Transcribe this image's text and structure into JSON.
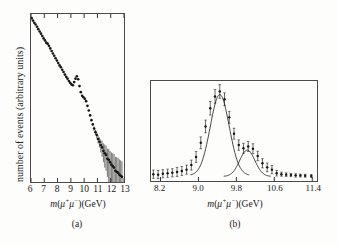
{
  "figure": {
    "background_color": "#fdfdfb",
    "ink_color": "#161616"
  },
  "panel_a": {
    "caption": "(a)",
    "ylabel": "number of events (arbitrary units)",
    "xlabel_prefix": "m",
    "xlabel_open": "(",
    "xlabel_mu_plus": "μ",
    "xlabel_sup_plus": "+",
    "xlabel_mu_minus": "μ",
    "xlabel_sup_minus": "−",
    "xlabel_close": ")(GeV)",
    "xlabel_full": "m(μ+μ−)(GeV)",
    "xticks": [
      "6",
      "7",
      "8",
      "9",
      "10",
      "11",
      "12",
      "13"
    ]
  },
  "panel_b": {
    "caption": "(b)",
    "xlabel_full": "m(μ+μ−)(GeV)",
    "xticks": [
      "8.2",
      "9.0",
      "9.8",
      "10.6",
      "11.4"
    ]
  },
  "chart_data": [
    {
      "type": "scatter",
      "panel": "a",
      "title": "",
      "xlabel": "m(μ+μ−)(GeV)",
      "ylabel": "number of events (arbitrary units)",
      "xlim": [
        6,
        13
      ],
      "ylim": [
        0.0008,
        1.2
      ],
      "yscale": "log",
      "grid": false,
      "legend": "none",
      "notes": "Dimuon invariant-mass spectrum; falling continuum with an excess (Upsilon) near 9.5 GeV; growing statistical error bars above 11 GeV.",
      "points": [
        {
          "x": 6.05,
          "y": 1.0,
          "err": 0.0
        },
        {
          "x": 6.15,
          "y": 0.9,
          "err": 0.0
        },
        {
          "x": 6.25,
          "y": 0.82,
          "err": 0.0
        },
        {
          "x": 6.35,
          "y": 0.76,
          "err": 0.0
        },
        {
          "x": 6.45,
          "y": 0.69,
          "err": 0.0
        },
        {
          "x": 6.55,
          "y": 0.62,
          "err": 0.0
        },
        {
          "x": 6.65,
          "y": 0.56,
          "err": 0.0
        },
        {
          "x": 6.75,
          "y": 0.51,
          "err": 0.0
        },
        {
          "x": 6.85,
          "y": 0.46,
          "err": 0.0
        },
        {
          "x": 6.95,
          "y": 0.415,
          "err": 0.0
        },
        {
          "x": 7.05,
          "y": 0.38,
          "err": 0.0
        },
        {
          "x": 7.15,
          "y": 0.345,
          "err": 0.0
        },
        {
          "x": 7.25,
          "y": 0.33,
          "err": 0.0
        },
        {
          "x": 7.35,
          "y": 0.3,
          "err": 0.0
        },
        {
          "x": 7.45,
          "y": 0.268,
          "err": 0.0
        },
        {
          "x": 7.55,
          "y": 0.24,
          "err": 0.0
        },
        {
          "x": 7.65,
          "y": 0.215,
          "err": 0.0
        },
        {
          "x": 7.75,
          "y": 0.195,
          "err": 0.0
        },
        {
          "x": 7.85,
          "y": 0.175,
          "err": 0.0
        },
        {
          "x": 7.95,
          "y": 0.158,
          "err": 0.0
        },
        {
          "x": 8.05,
          "y": 0.142,
          "err": 0.0
        },
        {
          "x": 8.15,
          "y": 0.128,
          "err": 0.0
        },
        {
          "x": 8.25,
          "y": 0.118,
          "err": 0.0
        },
        {
          "x": 8.35,
          "y": 0.106,
          "err": 0.0
        },
        {
          "x": 8.45,
          "y": 0.096,
          "err": 0.0
        },
        {
          "x": 8.55,
          "y": 0.086,
          "err": 0.0
        },
        {
          "x": 8.65,
          "y": 0.078,
          "err": 0.0
        },
        {
          "x": 8.75,
          "y": 0.072,
          "err": 0.0
        },
        {
          "x": 8.85,
          "y": 0.065,
          "err": 0.0
        },
        {
          "x": 8.95,
          "y": 0.06,
          "err": 0.0
        },
        {
          "x": 9.05,
          "y": 0.056,
          "err": 0.0
        },
        {
          "x": 9.15,
          "y": 0.054,
          "err": 0.0
        },
        {
          "x": 9.25,
          "y": 0.062,
          "err": 0.0
        },
        {
          "x": 9.35,
          "y": 0.072,
          "err": 0.0
        },
        {
          "x": 9.45,
          "y": 0.08,
          "err": 0.0
        },
        {
          "x": 9.55,
          "y": 0.07,
          "err": 0.0
        },
        {
          "x": 9.65,
          "y": 0.052,
          "err": 0.0
        },
        {
          "x": 9.75,
          "y": 0.04,
          "err": 0.0
        },
        {
          "x": 9.85,
          "y": 0.034,
          "err": 0.0
        },
        {
          "x": 9.95,
          "y": 0.032,
          "err": 0.0
        },
        {
          "x": 10.05,
          "y": 0.03,
          "err": 0.0
        },
        {
          "x": 10.15,
          "y": 0.027,
          "err": 0.0
        },
        {
          "x": 10.25,
          "y": 0.022,
          "err": 0.0
        },
        {
          "x": 10.35,
          "y": 0.018,
          "err": 0.0
        },
        {
          "x": 10.45,
          "y": 0.0145,
          "err": 0.0
        },
        {
          "x": 10.55,
          "y": 0.0118,
          "err": 0.0
        },
        {
          "x": 10.65,
          "y": 0.0098,
          "err": 0.0
        },
        {
          "x": 10.75,
          "y": 0.0082,
          "err": 0.0008
        },
        {
          "x": 10.85,
          "y": 0.007,
          "err": 0.0008
        },
        {
          "x": 10.95,
          "y": 0.0062,
          "err": 0.0009
        },
        {
          "x": 11.05,
          "y": 0.0052,
          "err": 0.0009
        },
        {
          "x": 11.15,
          "y": 0.0046,
          "err": 0.001
        },
        {
          "x": 11.25,
          "y": 0.004,
          "err": 0.0011
        },
        {
          "x": 11.35,
          "y": 0.0036,
          "err": 0.0012
        },
        {
          "x": 11.45,
          "y": 0.0031,
          "err": 0.0012
        },
        {
          "x": 11.55,
          "y": 0.0028,
          "err": 0.0013
        },
        {
          "x": 11.65,
          "y": 0.0026,
          "err": 0.0013
        },
        {
          "x": 11.75,
          "y": 0.0022,
          "err": 0.0012
        },
        {
          "x": 11.85,
          "y": 0.0021,
          "err": 0.0013
        },
        {
          "x": 11.95,
          "y": 0.0019,
          "err": 0.0012
        },
        {
          "x": 12.05,
          "y": 0.0017,
          "err": 0.0012
        },
        {
          "x": 12.15,
          "y": 0.0016,
          "err": 0.0012
        },
        {
          "x": 12.25,
          "y": 0.0015,
          "err": 0.0012
        },
        {
          "x": 12.35,
          "y": 0.0013,
          "err": 0.0011
        },
        {
          "x": 12.45,
          "y": 0.00125,
          "err": 0.0011
        },
        {
          "x": 12.55,
          "y": 0.0012,
          "err": 0.0011
        },
        {
          "x": 12.65,
          "y": 0.0011,
          "err": 0.00105
        },
        {
          "x": 12.75,
          "y": 0.00105,
          "err": 0.001
        },
        {
          "x": 12.85,
          "y": 0.001,
          "err": 0.00097
        }
      ]
    },
    {
      "type": "scatter",
      "panel": "b",
      "title": "",
      "xlabel": "m(μ+μ−)(GeV)",
      "ylabel": "",
      "xlim": [
        8.0,
        11.5
      ],
      "ylim": [
        0,
        1.1
      ],
      "grid": false,
      "legend": "none",
      "notes": "Continuum-subtracted spectrum showing two fitted Gaussian resonances: a large peak near 9.45 GeV and a smaller one near 10.0 GeV.",
      "points": [
        {
          "x": 8.05,
          "y": 0.075,
          "err": 0.045
        },
        {
          "x": 8.15,
          "y": 0.07,
          "err": 0.045
        },
        {
          "x": 8.25,
          "y": 0.08,
          "err": 0.045
        },
        {
          "x": 8.35,
          "y": 0.085,
          "err": 0.045
        },
        {
          "x": 8.45,
          "y": 0.09,
          "err": 0.045
        },
        {
          "x": 8.55,
          "y": 0.1,
          "err": 0.05
        },
        {
          "x": 8.65,
          "y": 0.11,
          "err": 0.05
        },
        {
          "x": 8.75,
          "y": 0.125,
          "err": 0.05
        },
        {
          "x": 8.85,
          "y": 0.175,
          "err": 0.055
        },
        {
          "x": 8.95,
          "y": 0.265,
          "err": 0.06
        },
        {
          "x": 9.05,
          "y": 0.42,
          "err": 0.065
        },
        {
          "x": 9.15,
          "y": 0.6,
          "err": 0.07
        },
        {
          "x": 9.25,
          "y": 0.8,
          "err": 0.075
        },
        {
          "x": 9.35,
          "y": 0.93,
          "err": 0.075
        },
        {
          "x": 9.45,
          "y": 0.985,
          "err": 0.075
        },
        {
          "x": 9.55,
          "y": 0.9,
          "err": 0.07
        },
        {
          "x": 9.65,
          "y": 0.7,
          "err": 0.065
        },
        {
          "x": 9.75,
          "y": 0.52,
          "err": 0.06
        },
        {
          "x": 9.85,
          "y": 0.395,
          "err": 0.058
        },
        {
          "x": 9.95,
          "y": 0.36,
          "err": 0.055
        },
        {
          "x": 10.05,
          "y": 0.38,
          "err": 0.055
        },
        {
          "x": 10.15,
          "y": 0.355,
          "err": 0.055
        },
        {
          "x": 10.25,
          "y": 0.275,
          "err": 0.052
        },
        {
          "x": 10.35,
          "y": 0.195,
          "err": 0.05
        },
        {
          "x": 10.45,
          "y": 0.15,
          "err": 0.048
        },
        {
          "x": 10.55,
          "y": 0.125,
          "err": 0.045
        },
        {
          "x": 10.65,
          "y": 0.085,
          "err": 0.03
        },
        {
          "x": 10.75,
          "y": 0.075,
          "err": 0.022
        },
        {
          "x": 10.85,
          "y": 0.07,
          "err": 0.02
        },
        {
          "x": 10.95,
          "y": 0.066,
          "err": 0.018
        },
        {
          "x": 11.05,
          "y": 0.062,
          "err": 0.018
        },
        {
          "x": 11.15,
          "y": 0.06,
          "err": 0.016
        },
        {
          "x": 11.25,
          "y": 0.058,
          "err": 0.016
        },
        {
          "x": 11.38,
          "y": 0.056,
          "err": 0.016
        }
      ],
      "fit_curves": [
        {
          "name": "resonance-1",
          "peak_x": 9.45,
          "peak_y": 0.95,
          "sigma": 0.2,
          "baseline": 0.06
        },
        {
          "name": "resonance-2",
          "peak_x": 10.03,
          "peak_y": 0.34,
          "sigma": 0.16,
          "baseline": 0.05
        }
      ]
    }
  ]
}
